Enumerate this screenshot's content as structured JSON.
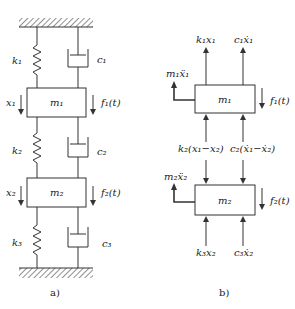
{
  "panel_a": {
    "caption": "a)",
    "springs": [
      {
        "label": "k₁"
      },
      {
        "label": "k₂"
      },
      {
        "label": "k₃"
      }
    ],
    "dampers": [
      {
        "label": "c₁"
      },
      {
        "label": "c₂"
      },
      {
        "label": "c₃"
      }
    ],
    "masses": [
      {
        "label": "m₁",
        "displacement": "x₁",
        "force": "f₁(t)"
      },
      {
        "label": "m₂",
        "displacement": "x₂",
        "force": "f₂(t)"
      }
    ]
  },
  "panel_b": {
    "caption": "b)",
    "mass1": {
      "label": "m₁",
      "inertia": "m₁ẍ₁",
      "force": "f₁(t)",
      "top_forces": [
        "k₁x₁",
        "c₁ẋ₁"
      ],
      "bottom_forces": [
        "k₂(x₁−x₂)",
        "c₂(ẋ₁−ẋ₂)"
      ]
    },
    "mass2": {
      "label": "m₂",
      "inertia": "m₂ẍ₂",
      "force": "f₂(t)",
      "bottom_forces": [
        "k₃x₂",
        "c₃ẋ₂"
      ]
    }
  },
  "colors": {
    "stroke": "#333333",
    "background": "#ffffff"
  }
}
